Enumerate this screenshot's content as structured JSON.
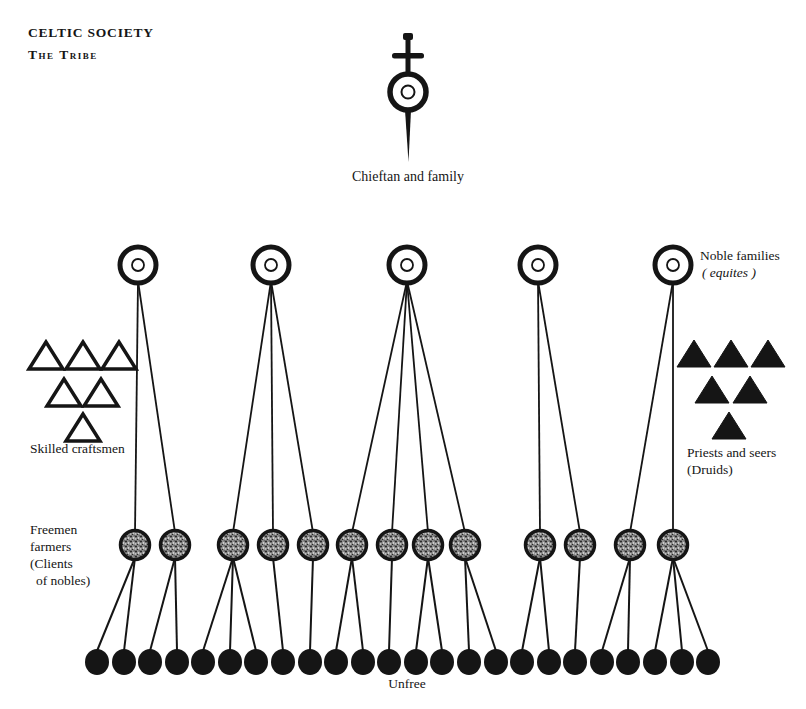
{
  "title": "CELTIC SOCIETY",
  "subtitle": "The Tribe",
  "labels": {
    "chieftain": "Chieftan and family",
    "nobles_line1": "Noble families",
    "nobles_line2": "( equites )",
    "craftsmen": "Skilled craftsmen",
    "priests_line1": "Priests and seers",
    "priests_line2": "(Druids)",
    "freemen_line1": "Freemen",
    "freemen_line2": "farmers",
    "freemen_line3": "(Clients",
    "freemen_line4": "of nobles)",
    "unfree": "Unfree"
  },
  "colors": {
    "ink": "#151515",
    "paper": "#ffffff",
    "stipple_base": "#8f8f8f"
  },
  "diagram": {
    "chieftain": {
      "x": 408,
      "circle_cy": 92,
      "outer_r": 18,
      "inner_r": 6.5,
      "pommel_top_y": 33,
      "guard_y": 53,
      "guard_half_width": 16,
      "blade_tip_y": 162
    },
    "nobles": {
      "y": 265,
      "outer_r": 18,
      "inner_r": 6,
      "x": [
        138,
        271,
        407,
        538,
        673
      ]
    },
    "freemen": {
      "y": 545,
      "r": 14.5,
      "x": [
        135,
        175,
        233,
        273,
        313,
        352,
        392,
        428,
        465,
        540,
        580,
        630,
        673
      ]
    },
    "unfree": {
      "y": 662,
      "rx": 12,
      "ry": 13,
      "x": [
        97,
        124,
        150,
        177,
        203,
        230,
        256,
        283,
        310,
        336,
        363,
        389,
        416,
        442,
        469,
        496,
        522,
        549,
        575,
        602,
        628,
        655,
        682,
        708
      ]
    },
    "craftsmen_triangles": {
      "filled": false,
      "centers": [
        [
          46,
          357
        ],
        [
          83,
          357
        ],
        [
          119,
          357
        ],
        [
          64,
          394
        ],
        [
          101,
          394
        ],
        [
          83,
          429
        ]
      ]
    },
    "druid_triangles": {
      "filled": true,
      "centers": [
        [
          694,
          355
        ],
        [
          731,
          355
        ],
        [
          768,
          355
        ],
        [
          712,
          391
        ],
        [
          750,
          391
        ],
        [
          729,
          427
        ]
      ]
    },
    "edges_noble_to_freemen": [
      [
        0,
        0
      ],
      [
        0,
        1
      ],
      [
        1,
        2
      ],
      [
        1,
        3
      ],
      [
        1,
        4
      ],
      [
        2,
        5
      ],
      [
        2,
        6
      ],
      [
        2,
        7
      ],
      [
        2,
        8
      ],
      [
        3,
        9
      ],
      [
        3,
        10
      ],
      [
        4,
        11
      ],
      [
        4,
        12
      ]
    ],
    "edges_freemen_to_unfree": [
      [
        0,
        0
      ],
      [
        0,
        1
      ],
      [
        1,
        2
      ],
      [
        1,
        3
      ],
      [
        2,
        4
      ],
      [
        2,
        5
      ],
      [
        2,
        6
      ],
      [
        3,
        7
      ],
      [
        4,
        8
      ],
      [
        5,
        9
      ],
      [
        5,
        10
      ],
      [
        6,
        11
      ],
      [
        7,
        12
      ],
      [
        7,
        13
      ],
      [
        8,
        14
      ],
      [
        8,
        15
      ],
      [
        9,
        16
      ],
      [
        9,
        17
      ],
      [
        10,
        18
      ],
      [
        11,
        19
      ],
      [
        11,
        20
      ],
      [
        12,
        21
      ],
      [
        12,
        22
      ],
      [
        12,
        23
      ]
    ]
  }
}
